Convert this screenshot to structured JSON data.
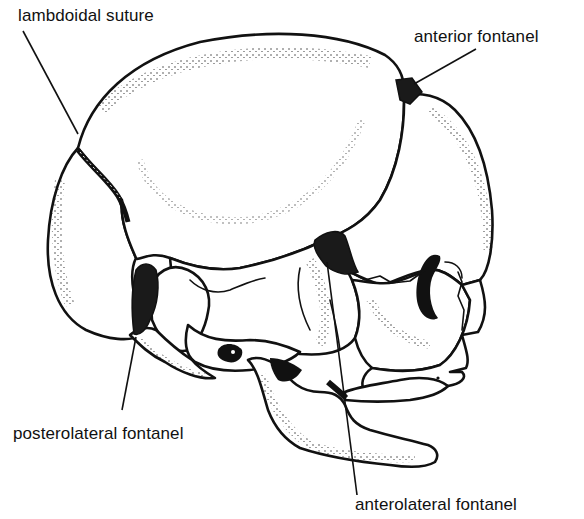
{
  "figure": {
    "labels": [
      {
        "id": "lambdoidal",
        "text": "lambdoidal suture"
      },
      {
        "id": "anterior",
        "text": "anterior fontanel"
      },
      {
        "id": "posterolateral",
        "text": "posterolateral fontanel"
      },
      {
        "id": "anterolateral",
        "text": "anterolateral fontanel"
      }
    ]
  },
  "colors": {
    "ink": "#111111",
    "background": "#ffffff"
  }
}
